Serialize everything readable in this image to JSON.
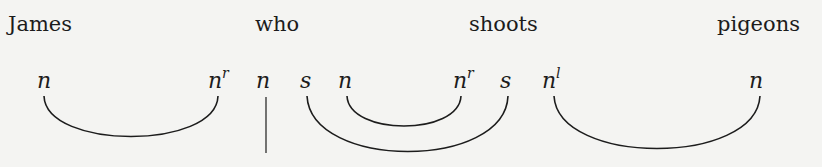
{
  "diagram": {
    "type": "pregroup-grammar-reduction",
    "words": [
      {
        "label": "James",
        "x": 8
      },
      {
        "label": "who",
        "x": 255
      },
      {
        "label": "shoots",
        "x": 469
      },
      {
        "label": "pigeons",
        "x": 717
      }
    ],
    "types": [
      {
        "base": "n",
        "adj": "",
        "x": 37
      },
      {
        "base": "n",
        "adj": "r",
        "x": 208
      },
      {
        "base": "n",
        "adj": "",
        "x": 256
      },
      {
        "base": "s",
        "adj": "",
        "x": 300
      },
      {
        "base": "n",
        "adj": "",
        "x": 338
      },
      {
        "base": "n",
        "adj": "r",
        "x": 453
      },
      {
        "base": "s",
        "adj": "",
        "x": 500
      },
      {
        "base": "n",
        "adj": "l",
        "x": 542
      },
      {
        "base": "n",
        "adj": "",
        "x": 749
      }
    ],
    "reductions": [
      {
        "from": 0,
        "to": 1,
        "label": "n · n^r"
      },
      {
        "from": 4,
        "to": 5,
        "label": "n · n^r"
      },
      {
        "from": 3,
        "to": 6,
        "label": "s · s"
      },
      {
        "from": 7,
        "to": 8,
        "label": "n^l · n"
      }
    ],
    "output_wire": {
      "type_index": 2,
      "label": "n"
    }
  }
}
